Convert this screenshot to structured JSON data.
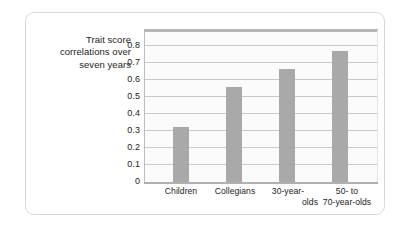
{
  "chart_data": {
    "type": "bar",
    "title": "",
    "subtitle": "",
    "xlabel": "",
    "ylabel": "Trait score correlations over seven years",
    "ylabel_lines": [
      "Trait score",
      "correlations over",
      "seven years"
    ],
    "categories": [
      "Children",
      "Collegians",
      "30-year-olds",
      "50- to 70-year-olds"
    ],
    "category_label_lines": [
      [
        "Children"
      ],
      [
        "Collegians"
      ],
      [
        "30-year-",
        "olds"
      ],
      [
        "50- to",
        "70-year-olds"
      ]
    ],
    "values": [
      0.31,
      0.53,
      0.63,
      0.73
    ],
    "ylim": [
      0,
      0.85
    ],
    "yticks": [
      "0.8",
      "0.7",
      "0.6",
      "0.5",
      "0.4",
      "0.3",
      "0.2",
      "0.1",
      "0"
    ],
    "ytick_values": [
      0.8,
      0.7,
      0.6,
      0.5,
      0.4,
      0.3,
      0.2,
      0.1,
      0
    ],
    "grid": true,
    "grid_axis": "y",
    "legend": false,
    "legend_position": "none",
    "bar_color": "#a9a9a9",
    "plot_background": "#fbfbfb",
    "gridline_color": "#c9c9c9",
    "axis_color": "#b0b0b0",
    "text_color": "#1d1d1b",
    "card_border_color": "#d8d8d8",
    "page_background": "#ffffff"
  }
}
